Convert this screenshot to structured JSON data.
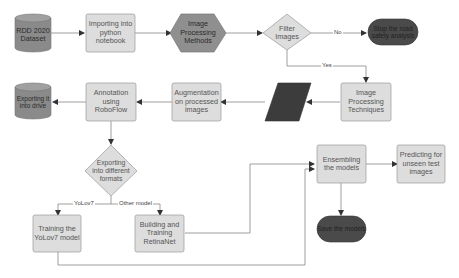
{
  "colors": {
    "box_fill": "#dddddd",
    "box_stroke": "#9a9a9a",
    "dark_fill": "#4a4a4a",
    "cylinder_fill": "#8a8a8a",
    "hex_fill": "#8f8f8f",
    "line": "#777777"
  },
  "nodes": {
    "rdd_dataset": "RDD 2020 Dataset",
    "importing": "Importing into python notebook",
    "image_processing_methods": "Image Processing Methods",
    "filter_images": "Filter Images",
    "stop_analysis": "Stop the road safety analysis",
    "image_processing_techniques": "Image Processing Techniques",
    "augmentation": "Augmentation on processed images",
    "annotation": "Annotation using RoboFlow",
    "exporting_drive": "Exporting it into drive",
    "exporting_formats": "Exporting into different formats",
    "training_yolov7": "Training the YoLov7 model",
    "building_retinanet": "Building and Training RetinaNet",
    "ensembling": "Ensembling the models",
    "predicting": "Predicting for unseen test images",
    "save_models": "Save the models"
  },
  "edges": {
    "no": "No",
    "yes": "Yes",
    "yolov7": "YoLov7",
    "other_model": "Other model"
  }
}
